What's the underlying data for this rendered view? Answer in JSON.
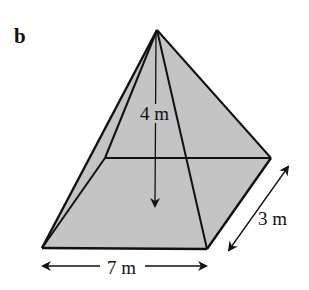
{
  "figure": {
    "part_label": "b",
    "shape": "square-based pyramid (rectangular base)",
    "fill_color": "#c4c4c4",
    "stroke_color": "#111111",
    "dimensions": {
      "height": {
        "label": "4 m",
        "value": 4,
        "unit": "m"
      },
      "width": {
        "label": "7 m",
        "value": 7,
        "unit": "m"
      },
      "depth": {
        "label": "3 m",
        "value": 3,
        "unit": "m"
      }
    },
    "vertices": {
      "apex": [
        157,
        30
      ],
      "front_left": [
        42,
        248
      ],
      "front_right": [
        207,
        249
      ],
      "back_right": [
        271,
        158
      ],
      "back_left": [
        105,
        158
      ]
    }
  }
}
